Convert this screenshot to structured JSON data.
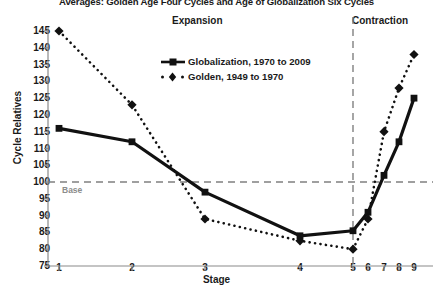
{
  "chart_data": {
    "type": "line",
    "title": "Averages: Golden Age Four Cycles and Age of Globalization Six Cycles",
    "xlabel": "Stage",
    "ylabel": "Cycle Relatives",
    "x": [
      1,
      2,
      3,
      4,
      5,
      6,
      7,
      8,
      9
    ],
    "categories": [
      "1",
      "2",
      "3",
      "4",
      "5",
      "6",
      "7",
      "8",
      "9"
    ],
    "xtick_labels": [
      "1",
      "2",
      "3",
      "4",
      "5",
      "6",
      "7",
      "8",
      "9"
    ],
    "ytick_labels": [
      "145",
      "140",
      "135",
      "130",
      "125",
      "120",
      "115",
      "110",
      "105",
      "100",
      "95",
      "90",
      "85",
      "80",
      "75"
    ],
    "ylim": [
      75,
      145
    ],
    "ytick_step": 5,
    "grid": false,
    "legend_position": "upper-center",
    "series": [
      {
        "name": "Globalization, 1970 to 2009",
        "label": "Globalization, 1970 to 2009",
        "style": "solid",
        "marker": "square",
        "color": "#111111",
        "x": [
          1,
          2,
          3,
          4,
          5,
          6,
          7,
          8,
          9
        ],
        "values": [
          116,
          112,
          97,
          84,
          85.5,
          91,
          102,
          112,
          125
        ]
      },
      {
        "name": "Golden, 1949 to 1970",
        "label": "Golden, 1949 to 1970",
        "style": "dotted",
        "marker": "diamond",
        "color": "#111111",
        "x": [
          1,
          2,
          3,
          4,
          5,
          6,
          7,
          8,
          9
        ],
        "values": [
          145,
          123,
          89,
          82.5,
          80,
          89,
          115,
          128,
          138
        ]
      }
    ],
    "annotations": [
      {
        "text": "Expansion",
        "type": "region-label",
        "region": "left"
      },
      {
        "text": "Contraction",
        "type": "region-label",
        "region": "right"
      },
      {
        "text": "Base",
        "type": "reference-line-label",
        "value": 100
      }
    ],
    "reference_lines": [
      {
        "orientation": "horizontal",
        "value": 100,
        "style": "dashed",
        "color": "#808080",
        "label": "Base"
      },
      {
        "orientation": "vertical",
        "value": 5,
        "style": "dashed",
        "color": "#808080"
      }
    ]
  }
}
